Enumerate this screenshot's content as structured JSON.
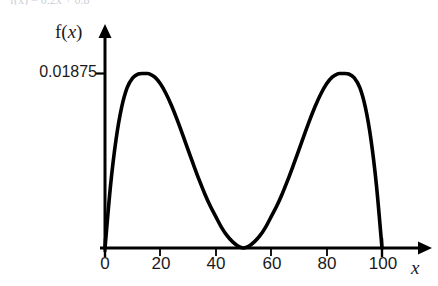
{
  "figure": {
    "clipped_header_text": "f(x) = 0.2x + 0.8",
    "y_axis_label": "f(x)",
    "x_axis_label": "x",
    "y_tick_label": "0.01875",
    "x_tick_labels": [
      "0",
      "20",
      "40",
      "60",
      "80",
      "100"
    ],
    "curve_color": "#000000",
    "axis_color": "#000000",
    "background_color": "#ffffff"
  },
  "chart_data": {
    "type": "line",
    "title": "",
    "subtitle": "",
    "xlabel": "x",
    "ylabel": "f(x)",
    "xlim": [
      0,
      100
    ],
    "ylim": [
      0,
      0.01875
    ],
    "grid": false,
    "legend": null,
    "xticks": [
      0,
      20,
      40,
      60,
      80,
      100
    ],
    "xticklabels": [
      "0",
      "20",
      "40",
      "60",
      "80",
      "100"
    ],
    "yticks": [
      0.01875
    ],
    "yticklabels": [
      "0.01875"
    ],
    "annotations": [
      {
        "text": "local maximum",
        "x": 15,
        "y": 0.01875
      },
      {
        "text": "zero (tangent)",
        "x": 50,
        "y": 0
      },
      {
        "text": "local maximum",
        "x": 85,
        "y": 0.01875
      }
    ],
    "series": [
      {
        "name": "f(x)",
        "x": [
          0,
          2,
          4,
          6,
          8,
          10,
          12,
          14,
          15,
          16,
          18,
          20,
          22,
          24,
          26,
          28,
          30,
          32,
          34,
          36,
          38,
          40,
          42,
          44,
          46,
          48,
          50,
          52,
          54,
          56,
          58,
          60,
          62,
          64,
          66,
          68,
          70,
          72,
          74,
          76,
          78,
          80,
          82,
          84,
          85,
          86,
          88,
          90,
          92,
          94,
          96,
          98,
          100
        ],
        "y": [
          0,
          0.00672,
          0.01168,
          0.0151,
          0.01722,
          0.01828,
          0.0187,
          0.01875,
          0.01875,
          0.01872,
          0.01836,
          0.01764,
          0.0166,
          0.01531,
          0.01382,
          0.01221,
          0.01055,
          0.0089,
          0.00731,
          0.00583,
          0.00451,
          0.00337,
          0.00225,
          0.00135,
          0.00068,
          0.00022,
          0.0,
          0.00022,
          0.00068,
          0.00135,
          0.00225,
          0.00337,
          0.00451,
          0.00583,
          0.00731,
          0.0089,
          0.01055,
          0.01221,
          0.01382,
          0.01531,
          0.0166,
          0.01764,
          0.01836,
          0.01872,
          0.01875,
          0.01875,
          0.0187,
          0.01828,
          0.01722,
          0.0151,
          0.01168,
          0.00672,
          0
        ]
      }
    ]
  }
}
